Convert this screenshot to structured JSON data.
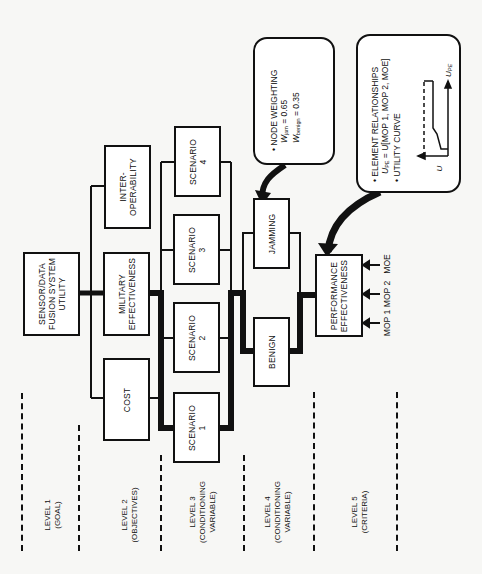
{
  "diagram": {
    "orientation": "rotated 90 degrees counterclockwise",
    "level1": {
      "goal": "SENSOR/DATA\nFUSION SYSTEM\nUTILITY"
    },
    "level2": {
      "objectives": [
        "COST",
        "MILITARY\nEFFECTIVENESS",
        "INTER-\nOPERABILITY"
      ]
    },
    "level3": {
      "scenarios": [
        "SCENARIO\n1",
        "SCENARIO\n2",
        "SCENARIO\n3",
        "SCENARIO\n4"
      ]
    },
    "level4": {
      "conditions": [
        "BENIGN",
        "JAMMING"
      ]
    },
    "level5": {
      "criteria": "PERFORMANCE\nEFFECTIVENESS",
      "inputs": [
        "MOP 1",
        "MOP 2",
        "MOE"
      ]
    },
    "node_weighting_callout": {
      "title": "• NODE WEIGHTING",
      "w_jam_label": "W",
      "w_jam_sub": "jam",
      "w_jam_value": " = 0.65",
      "w_benign_label": "W",
      "w_benign_sub": "benign",
      "w_benign_value": " = 0.35"
    },
    "element_callout": {
      "title": "• ELEMENT RELATIONSHIPS",
      "formula_label": "U",
      "formula_sub": "PE",
      "formula_rest": " = U[MOP 1, MOP 2, MOE]",
      "curve_title": "• UTILITY CURVE",
      "curve_y_label": "U",
      "curve_x_label": "U",
      "curve_x_sub": "PE"
    },
    "level_labels": [
      "LEVEL 1\n(GOAL)",
      "LEVEL 2\n(OBJECTIVES)",
      "LEVEL 3\n(CONDITIONING\nVARIABLE)",
      "LEVEL 4\n(CONDITIONING\nVARIABLE)",
      "LEVEL 5\n(CRITERIA)"
    ]
  }
}
